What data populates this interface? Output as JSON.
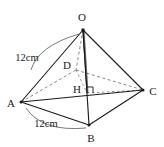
{
  "figure": {
    "type": "geometry-diagram",
    "stroke_color": "#1a1a1a",
    "dashed_color": "#7a7a7a",
    "background_color": "#ffffff",
    "vertices": [
      {
        "name": "O",
        "label": "O",
        "point_x": 83,
        "point_y": 30,
        "label_x": 82,
        "label_y": 17
      },
      {
        "name": "D",
        "label": "D",
        "point_x": 76,
        "point_y": 70,
        "label_x": 67,
        "label_y": 65
      },
      {
        "name": "C",
        "label": "C",
        "point_x": 143,
        "point_y": 90,
        "label_x": 153,
        "label_y": 91
      },
      {
        "name": "A",
        "label": "A",
        "point_x": 21,
        "point_y": 102,
        "label_x": 11,
        "label_y": 103
      },
      {
        "name": "H",
        "label": "H",
        "point_x": 87,
        "point_y": 93,
        "label_x": 77,
        "label_y": 89
      },
      {
        "name": "B",
        "label": "B",
        "point_x": 89,
        "point_y": 125,
        "label_x": 91,
        "label_y": 138
      }
    ],
    "dimensions": [
      {
        "name": "edge-OA",
        "label": "12cm",
        "label_x": 27,
        "label_y": 58
      },
      {
        "name": "edge-AB",
        "label": "12cm",
        "label_x": 46,
        "label_y": 124
      }
    ],
    "right_angle": {
      "name": "right-angle-at-H",
      "x": 87,
      "y": 93,
      "size": 6
    }
  }
}
